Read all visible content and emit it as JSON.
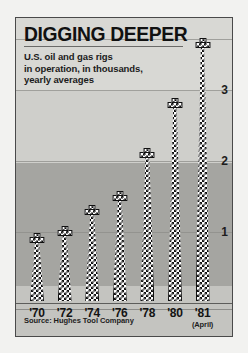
{
  "figure": {
    "title": "DIGGING DEEPER",
    "subtitle_lines": [
      "U.S. oil and gas rigs",
      "in operation, in thousands,",
      "yearly averages"
    ],
    "source": "Source: Hughes Tool Company",
    "colors": {
      "panel_background": "#c9c9c6",
      "plot_background": "#a5a5a1",
      "band_light": "#d8d8d4",
      "bar_fill": "#ffffff",
      "bar_pattern": "#101010",
      "border": "#4a4a4a",
      "text": "#111111"
    }
  },
  "chart_data": {
    "type": "bar",
    "title": "DIGGING DEEPER",
    "subtitle": "U.S. oil and gas rigs in operation, in thousands, yearly averages",
    "xlabel": "",
    "ylabel": "thousands of rigs",
    "ylim": [
      0,
      3.9
    ],
    "yticks": [
      1,
      2,
      3
    ],
    "ytick_labels": [
      "1",
      "2",
      "3"
    ],
    "grid": true,
    "legend": false,
    "bar_style": "oil-derrick",
    "categories": [
      "'70",
      "'72",
      "'74",
      "'76",
      "'78",
      "'80",
      "'81"
    ],
    "category_notes": [
      "",
      "",
      "",
      "",
      "",
      "",
      "(April)"
    ],
    "values": [
      0.9,
      1.0,
      1.3,
      1.5,
      2.1,
      2.8,
      3.65
    ],
    "annotation": "Source: Hughes Tool Company",
    "bars": [
      {
        "label": "'70",
        "note": "",
        "value": 0.9
      },
      {
        "label": "'72",
        "note": "",
        "value": 1.0
      },
      {
        "label": "'74",
        "note": "",
        "value": 1.3
      },
      {
        "label": "'76",
        "note": "",
        "value": 1.5
      },
      {
        "label": "'78",
        "note": "",
        "value": 2.1
      },
      {
        "label": "'80",
        "note": "",
        "value": 2.8
      },
      {
        "label": "'81",
        "note": "(April)",
        "value": 3.65
      }
    ]
  }
}
